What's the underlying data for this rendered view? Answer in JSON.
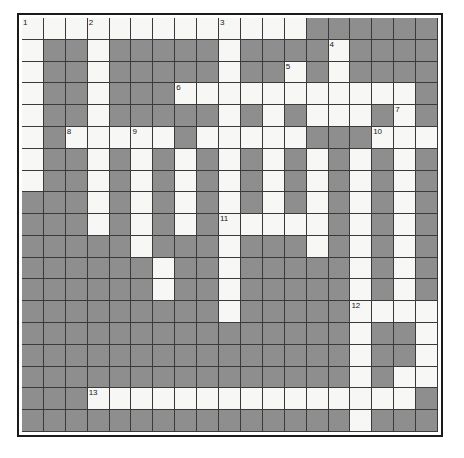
{
  "puzzle": {
    "type": "crossword-grid",
    "columns": 19,
    "rows": 19,
    "colors": {
      "open_cell": "#f7f7f5",
      "block_cell": "#8e8e8e",
      "grid_line": "#3a3a3a",
      "frame_border": "#1b1b1b",
      "page_background": "#ffffff",
      "number_text": "#16181a"
    },
    "legend": {
      "open": "o",
      "block": "#"
    },
    "grid_rows": [
      "ooooooooooooo######",
      "o##o#####o####o####",
      "o##o#####o##o#o####",
      "o##o###ooooooxo-oo#",
      "o##o#####o#o#ooo#o#",
      "o#ooooo#ooooo###ooo",
      "o##o#o#o#o#o#o#o#o#",
      "o##o#o#o#o#o#o#o#o#",
      "###o#o#o#o#o#o#o#o#",
      "###o#o#o#ooooo#o#o#",
      "#####o###o###o#o#o#",
      "######o##o#####o#o#",
      "######o##o#####o#o#",
      "#########o#####oooo",
      "###############o##o",
      "###############o##o",
      "###############o#oo",
      "###ooooooooooooooo#",
      "###############o###"
    ],
    "numbers": [
      {
        "label": "1",
        "row": 0,
        "col": 0
      },
      {
        "label": "2",
        "row": 0,
        "col": 3
      },
      {
        "label": "3",
        "row": 0,
        "col": 9
      },
      {
        "label": "4",
        "row": 1,
        "col": 14
      },
      {
        "label": "5",
        "row": 2,
        "col": 12
      },
      {
        "label": "6",
        "row": 3,
        "col": 7
      },
      {
        "label": "7",
        "row": 4,
        "col": 17
      },
      {
        "label": "8",
        "row": 5,
        "col": 2
      },
      {
        "label": "9",
        "row": 5,
        "col": 5
      },
      {
        "label": "10",
        "row": 5,
        "col": 16
      },
      {
        "label": "11",
        "row": 9,
        "col": 9
      },
      {
        "label": "12",
        "row": 13,
        "col": 15
      },
      {
        "label": "13",
        "row": 17,
        "col": 3
      }
    ]
  }
}
